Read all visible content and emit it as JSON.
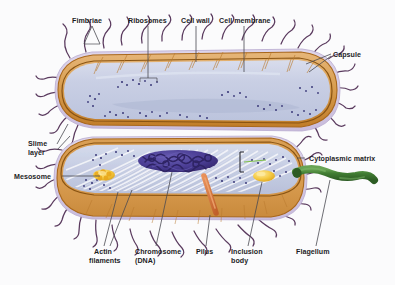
{
  "figure": {
    "background_color": "#fbfbfc",
    "organism": "bacterium",
    "view": "two cut-away cells, upper and lower, longitudinal section"
  },
  "labels": [
    {
      "id": "fimbriae",
      "text": "Fimbriae",
      "x": 72,
      "y": 17,
      "align": "left"
    },
    {
      "id": "ribosomes",
      "text": "Ribosomes",
      "x": 128,
      "y": 17,
      "align": "left"
    },
    {
      "id": "cell-wall",
      "text": "Cell wall",
      "x": 181,
      "y": 17,
      "align": "left"
    },
    {
      "id": "cell-membrane",
      "text": "Cell membrane",
      "x": 219,
      "y": 17,
      "align": "left"
    },
    {
      "id": "capsule",
      "text": "Capsule",
      "x": 333,
      "y": 51,
      "align": "left"
    },
    {
      "id": "slime-layer-1",
      "text": "Slime",
      "x": 28,
      "y": 140,
      "align": "left"
    },
    {
      "id": "slime-layer-2",
      "text": "layer",
      "x": 28,
      "y": 149,
      "align": "left"
    },
    {
      "id": "mesosome",
      "text": "Mesosome",
      "x": 14,
      "y": 173,
      "align": "left"
    },
    {
      "id": "cytoplasmic-matrix",
      "text": "Cytoplasmic matrix",
      "x": 309,
      "y": 155,
      "align": "left"
    },
    {
      "id": "actin-filaments-1",
      "text": "Actin",
      "x": 94,
      "y": 248,
      "align": "left"
    },
    {
      "id": "actin-filaments-2",
      "text": "filaments",
      "x": 89,
      "y": 257,
      "align": "left"
    },
    {
      "id": "chromosome-1",
      "text": "Chromosome",
      "x": 135,
      "y": 248,
      "align": "left"
    },
    {
      "id": "chromosome-2",
      "text": "(DNA)",
      "x": 135,
      "y": 257,
      "align": "left"
    },
    {
      "id": "pilus",
      "text": "Pilus",
      "x": 196,
      "y": 248,
      "align": "left"
    },
    {
      "id": "inclusion-body-1",
      "text": "Inclusion",
      "x": 231,
      "y": 248,
      "align": "left"
    },
    {
      "id": "inclusion-body-2",
      "text": "body",
      "x": 231,
      "y": 257,
      "align": "left"
    },
    {
      "id": "flagellum",
      "text": "Flagellum",
      "x": 296,
      "y": 248,
      "align": "left"
    }
  ],
  "structures": [
    {
      "id": "capsule",
      "name": "Capsule",
      "color": "#cfc2dd"
    },
    {
      "id": "cell-wall",
      "name": "Cell wall",
      "color": "#c0791f"
    },
    {
      "id": "cell-membrane",
      "name": "Cell membrane",
      "color": "#8a5412"
    },
    {
      "id": "cytoplasm",
      "name": "Cytoplasmic matrix",
      "color": "#ccd2e6"
    },
    {
      "id": "cell-body-outer",
      "name": "Cell body exterior",
      "color": "#d79b52"
    },
    {
      "id": "ribosome",
      "name": "Ribosome",
      "color": "#3b3a7a"
    },
    {
      "id": "chromosome",
      "name": "Chromosome (DNA)",
      "color": "#4a3d93"
    },
    {
      "id": "actin-filaments",
      "name": "Actin filaments",
      "color": "#f2f2f6"
    },
    {
      "id": "mesosome",
      "name": "Mesosome",
      "color": "#f0c23d"
    },
    {
      "id": "inclusion-body",
      "name": "Inclusion body",
      "color": "#f3c746"
    },
    {
      "id": "pilus",
      "name": "Pilus",
      "color": "#d4743c"
    },
    {
      "id": "flagellum",
      "name": "Flagellum",
      "color": "#3f7a35"
    },
    {
      "id": "fimbriae",
      "name": "Fimbriae",
      "color": "#5a3a5e"
    },
    {
      "id": "slime-layer",
      "name": "Slime layer",
      "color": "#ddd2e8"
    },
    {
      "id": "leader-line",
      "name": "Leader line",
      "color": "#4a4a52"
    }
  ]
}
